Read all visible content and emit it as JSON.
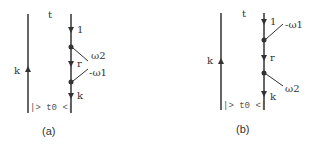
{
  "diagrams": [
    {
      "caption": "(a)",
      "top_label": "t",
      "left_line_label": "k",
      "bottom_label": "|> t0 <|",
      "right_line_labels": [
        "1",
        "r",
        "k"
      ],
      "vertex_labels": [
        "ω2",
        "-ω1"
      ]
    },
    {
      "caption": "(b)",
      "top_label": "t",
      "left_line_label": "k",
      "bottom_label": "|> t0 <|",
      "right_line_labels": [
        "1",
        "r",
        "k"
      ],
      "vertex_labels": [
        "-ω1",
        "ω2"
      ]
    }
  ]
}
